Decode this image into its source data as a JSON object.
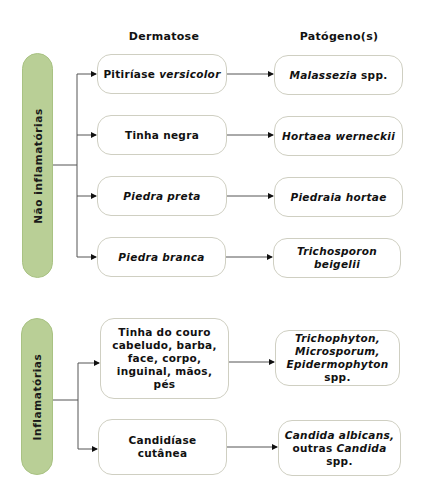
{
  "headers": {
    "dermatose": "Dermatose",
    "patogeno": "Patógeno(s)"
  },
  "groups": [
    {
      "label": "Não inflamatórias",
      "color": "#b9cf96",
      "rows": [
        {
          "dermatose": [
            {
              "t": "Pitiríase "
            },
            {
              "t": "versicolor",
              "i": true
            }
          ],
          "patogeno": [
            {
              "t": "Malassezia",
              "i": true
            },
            {
              "t": " spp."
            }
          ]
        },
        {
          "dermatose": [
            {
              "t": "Tinha negra"
            }
          ],
          "patogeno": [
            {
              "t": "Hortaea werneckii",
              "i": true
            }
          ]
        },
        {
          "dermatose": [
            {
              "t": "Piedra preta",
              "i": true
            }
          ],
          "patogeno": [
            {
              "t": "Piedraia hortae",
              "i": true
            }
          ]
        },
        {
          "dermatose": [
            {
              "t": "Piedra branca",
              "i": true
            }
          ],
          "patogeno": [
            {
              "t": "Trichosporon",
              "i": true
            },
            {
              "br": true
            },
            {
              "t": "beigelii",
              "i": true
            }
          ]
        }
      ]
    },
    {
      "label": "Inflamatórias",
      "color": "#b9cf96",
      "rows": [
        {
          "dermatose": [
            {
              "t": "Tinha do couro"
            },
            {
              "br": true
            },
            {
              "t": "cabeludo, barba,"
            },
            {
              "br": true
            },
            {
              "t": "face, corpo,"
            },
            {
              "br": true
            },
            {
              "t": "inguinal, mãos, pés"
            }
          ],
          "patogeno": [
            {
              "t": "Trichophyton,",
              "i": true
            },
            {
              "br": true
            },
            {
              "t": "Microsporum,",
              "i": true
            },
            {
              "br": true
            },
            {
              "t": "Epidermophyton",
              "i": true
            },
            {
              "t": " spp."
            }
          ]
        },
        {
          "dermatose": [
            {
              "t": "Candidíase cutânea"
            }
          ],
          "patogeno": [
            {
              "t": "Candida albicans,",
              "i": true
            },
            {
              "br": true
            },
            {
              "t": "outras "
            },
            {
              "t": "Candida",
              "i": true
            },
            {
              "t": " spp."
            }
          ]
        }
      ]
    }
  ]
}
